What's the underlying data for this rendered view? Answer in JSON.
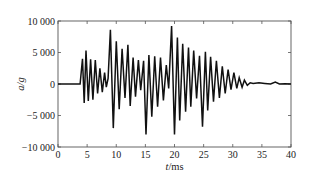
{
  "chart_data": {
    "type": "line",
    "title": "",
    "xlabel": "t/ms",
    "xlabel_var": "t",
    "xlabel_unit": "/ms",
    "ylabel": "a/g",
    "xlim": [
      0,
      40
    ],
    "ylim": [
      -10000,
      10000
    ],
    "grid": false,
    "legend": null,
    "xticks": [
      0,
      5,
      10,
      15,
      20,
      25,
      30,
      35,
      40
    ],
    "xtick_labels": [
      "0",
      "5",
      "10",
      "15",
      "20",
      "25",
      "30",
      "35",
      "40"
    ],
    "yticks": [
      10000,
      5000,
      0,
      -5000,
      -10000
    ],
    "ytick_labels": [
      "10 000",
      "5 000",
      "0",
      "−5 000",
      "−10 000"
    ],
    "series": [
      {
        "name": "acceleration",
        "color": "#111111",
        "x": [
          0,
          3.8,
          4.2,
          4.5,
          4.8,
          5.2,
          5.6,
          6.0,
          6.4,
          6.8,
          7.2,
          7.6,
          8.0,
          8.3,
          8.6,
          9.0,
          9.5,
          10.0,
          10.5,
          11.0,
          11.5,
          12.0,
          12.4,
          12.9,
          13.3,
          13.8,
          14.2,
          14.7,
          15.1,
          15.6,
          16.1,
          16.6,
          17.1,
          17.6,
          18.1,
          18.6,
          19.0,
          19.5,
          20.0,
          20.5,
          20.9,
          21.4,
          21.9,
          22.4,
          22.8,
          23.3,
          23.8,
          24.3,
          24.8,
          25.3,
          25.7,
          26.2,
          26.7,
          27.2,
          27.7,
          28.2,
          28.7,
          29.2,
          29.7,
          30.2,
          30.7,
          31.1,
          31.6,
          32.0,
          32.5,
          33.0,
          33.5,
          34.5,
          35.5,
          36.5,
          37.3,
          38.0,
          39.0,
          40.0
        ],
        "y": [
          0,
          0,
          4000,
          -3000,
          5300,
          -2700,
          3900,
          -2500,
          3800,
          -1500,
          2500,
          -1300,
          1800,
          -500,
          900,
          8600,
          -7000,
          6800,
          -4000,
          5600,
          -2200,
          6200,
          -3500,
          4200,
          -2000,
          3800,
          -1000,
          3700,
          -8000,
          4600,
          -5200,
          4400,
          -3600,
          4200,
          -2600,
          3000,
          -700,
          9200,
          -8000,
          7400,
          -5800,
          6400,
          -4400,
          5800,
          -3600,
          5300,
          -2300,
          4500,
          -6800,
          5100,
          -4200,
          4300,
          -2800,
          3700,
          -2200,
          2800,
          -1500,
          2300,
          -900,
          1800,
          -700,
          1000,
          -500,
          600,
          -200,
          200,
          100,
          200,
          100,
          0,
          300,
          0,
          50,
          0
        ]
      }
    ],
    "plot_area_px": {
      "left": 58,
      "top": 21,
      "right": 291,
      "bottom": 147
    }
  }
}
